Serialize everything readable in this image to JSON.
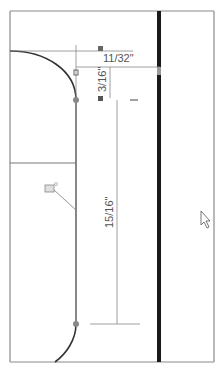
{
  "view": {
    "type": "cad-sketch-viewport",
    "background": "#ffffff",
    "frame_color": "#8a8a8a",
    "edge_color": "#333333",
    "dim_color": "#7a7a7a",
    "rail_color": "#1a1a1a"
  },
  "dimensions": [
    {
      "id": "dim-horizontal-top",
      "label": "11/32\"",
      "orientation": "horizontal"
    },
    {
      "id": "dim-vertical-short",
      "label": "3/16\"",
      "orientation": "vertical"
    },
    {
      "id": "dim-vertical-long",
      "label": "15/16\"",
      "orientation": "vertical"
    }
  ],
  "annotations": {
    "constraint_icon": "coincident-relation-icon",
    "cursor": "arrow-cursor-icon"
  }
}
